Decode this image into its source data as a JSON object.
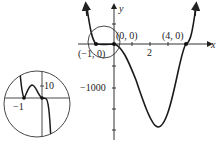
{
  "figure": {
    "axes": {
      "x_label": "x",
      "y_label": "y",
      "x_tick_label": "2",
      "y_tick_label": "−1000"
    },
    "points": [
      {
        "label": "(−1, 0)"
      },
      {
        "label": "(0, 0)"
      },
      {
        "label": "(4, 0)"
      }
    ],
    "inset": {
      "x_tick_label": "−1",
      "y_tick_label": "10"
    },
    "colors": {
      "curve": "#1a1a1a",
      "axes": "#333333",
      "background": "#ffffff"
    }
  }
}
